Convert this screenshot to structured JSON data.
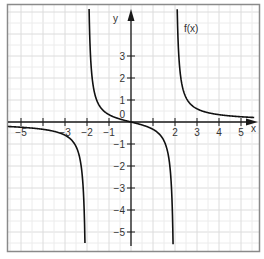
{
  "chart_data": {
    "type": "line",
    "title": "",
    "function": "f(x) = x/(x^2-4)",
    "series": [
      {
        "name": "f(x)",
        "branch": "left",
        "x": [
          -5.5,
          -5,
          -4.5,
          -4,
          -3.5,
          -3,
          -2.5,
          -2.2,
          -2.1,
          -2.05
        ],
        "values": [
          -0.21,
          -0.24,
          -0.28,
          -0.33,
          -0.42,
          -0.6,
          -1.11,
          -2.62,
          -5.12,
          -10
        ]
      },
      {
        "name": "f(x)",
        "branch": "middle",
        "x": [
          -1.9,
          -1.5,
          -1,
          -0.5,
          0,
          0.5,
          1,
          1.5,
          1.9
        ],
        "values": [
          4.87,
          0.86,
          0.33,
          0.13,
          0,
          -0.13,
          -0.33,
          -0.86,
          -4.87
        ]
      },
      {
        "name": "f(x)",
        "branch": "right",
        "x": [
          2.05,
          2.1,
          2.2,
          2.5,
          3,
          3.5,
          4,
          4.5,
          5,
          5.5
        ],
        "values": [
          10,
          5.12,
          2.62,
          1.11,
          0.6,
          0.42,
          0.33,
          0.28,
          0.24,
          0.21
        ]
      }
    ],
    "asymptotes": {
      "vertical": [
        -2,
        2
      ],
      "horizontal": [
        0
      ]
    },
    "xlabel": "x",
    "ylabel": "y",
    "curve_label": "f(x)",
    "x_ticks": [
      -5,
      -4,
      -3,
      -2,
      -1,
      1,
      2,
      3,
      4,
      5
    ],
    "x_tick_labels": [
      "−5",
      "",
      "−3",
      "−2",
      "−1",
      "",
      "2",
      "3",
      "4",
      "5"
    ],
    "y_ticks": [
      3,
      2,
      1,
      0,
      -1,
      -2,
      -3,
      -4,
      -5
    ],
    "y_tick_labels": [
      "3",
      "2",
      "1",
      "0",
      "−1",
      "−2",
      "−3",
      "−4",
      "−5"
    ],
    "xlim": [
      -5.6,
      5.6
    ],
    "ylim": [
      -5.8,
      5.3
    ],
    "grid": true,
    "grid_step": 0.5,
    "legend": "none"
  },
  "labels": {
    "x_axis": "x",
    "y_axis": "y",
    "curve": "f(x)"
  }
}
